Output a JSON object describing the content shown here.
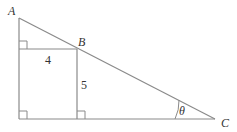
{
  "diagram": {
    "points": {
      "A": {
        "label": "A",
        "x": 19,
        "y": 18
      },
      "B": {
        "label": "B",
        "x": 77,
        "y": 49
      },
      "C": {
        "label": "C",
        "x": 215,
        "y": 119
      },
      "bottom_left": {
        "x": 19,
        "y": 119
      },
      "rect_bottom_right": {
        "x": 77,
        "y": 119
      },
      "rect_top_left": {
        "x": 19,
        "y": 49
      }
    },
    "labels": {
      "A": "A",
      "B": "B",
      "C": "C",
      "width": "4",
      "height": "5",
      "angle": "θ"
    },
    "colors": {
      "stroke": "#8a8a8a",
      "text": "#333333"
    }
  }
}
